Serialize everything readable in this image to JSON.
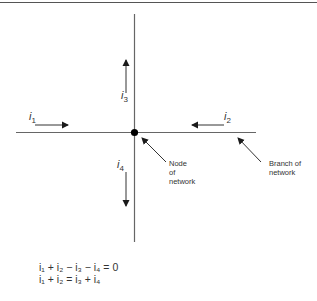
{
  "diagram": {
    "type": "kirchhoff-current-law-node",
    "currents": [
      {
        "id": "i1",
        "symbol": "i",
        "sub": "1",
        "direction": "into-node (rightward)"
      },
      {
        "id": "i2",
        "symbol": "i",
        "sub": "2",
        "direction": "into-node (leftward)"
      },
      {
        "id": "i3",
        "symbol": "i",
        "sub": "3",
        "direction": "out-of-node (upward)"
      },
      {
        "id": "i4",
        "symbol": "i",
        "sub": "4",
        "direction": "out-of-node (downward)"
      }
    ],
    "annotations": {
      "node": [
        "Node",
        "of",
        "network"
      ],
      "branch": [
        "Branch of",
        "network"
      ]
    },
    "equations": [
      "i₁ + i₂ − i₃ − i₄ = 0",
      "i₁ + i₂ = i₃ + i₄"
    ],
    "colors": {
      "line": "#555555",
      "arrow": "#1a1a1a",
      "node": "#000000",
      "text": "#333333"
    }
  }
}
